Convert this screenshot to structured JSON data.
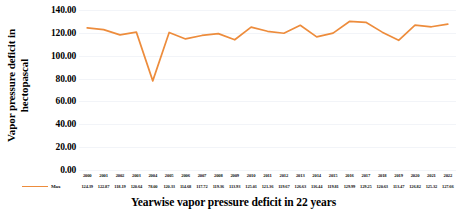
{
  "chart_data": {
    "type": "line",
    "title": "",
    "xlabel": "Yearwise vapor pressure deficit in 22 years",
    "ylabel": "Vapor pressure deficit in hectopascal",
    "ylabel_line1": "Vapor pressure deficit in",
    "ylabel_line2": "hectopascal",
    "categories": [
      "2000",
      "2001",
      "2002",
      "2003",
      "2004",
      "2005",
      "2006",
      "2007",
      "2008",
      "2009",
      "2010",
      "2011",
      "2012",
      "2013",
      "2014",
      "2015",
      "2016",
      "2017",
      "2018",
      "2019",
      "2020",
      "2021",
      "2022"
    ],
    "series": [
      {
        "name": "Max",
        "color": "#ED8C3C",
        "values": [
          124.39,
          122.87,
          118.19,
          120.64,
          78.0,
          120.33,
          114.68,
          117.72,
          119.36,
          113.93,
          125.01,
          121.36,
          119.67,
          126.63,
          116.44,
          119.81,
          129.99,
          129.25,
          120.63,
          113.47,
          126.82,
          125.32,
          127.66
        ],
        "value_labels": [
          "124.39",
          "122.87",
          "118.19",
          "120.64",
          "78.00",
          "120.33",
          "114.68",
          "117.72",
          "119.36",
          "113.93",
          "125.01",
          "121.36",
          "119.67",
          "126.63",
          "116.44",
          "119.81",
          "129.99",
          "129.25",
          "120.63",
          "113.47",
          "126.82",
          "125.32",
          "127.66"
        ]
      }
    ],
    "ylim": [
      0,
      140
    ],
    "yticks": [
      140.0,
      120.0,
      100.0,
      80.0,
      60.0,
      40.0,
      20.0,
      0.0
    ],
    "ytick_labels": [
      "140.00",
      "120.00",
      "100.00",
      "80.00",
      "60.00",
      "40.00",
      "20.00",
      "0.00"
    ],
    "grid": true,
    "legend_position": "bottom-left",
    "legend_entries": [
      "Max"
    ]
  },
  "colors": {
    "series_orange": "#ED8C3C",
    "gridline": "#f2f4f8",
    "text": "#000000",
    "background": "#ffffff"
  }
}
